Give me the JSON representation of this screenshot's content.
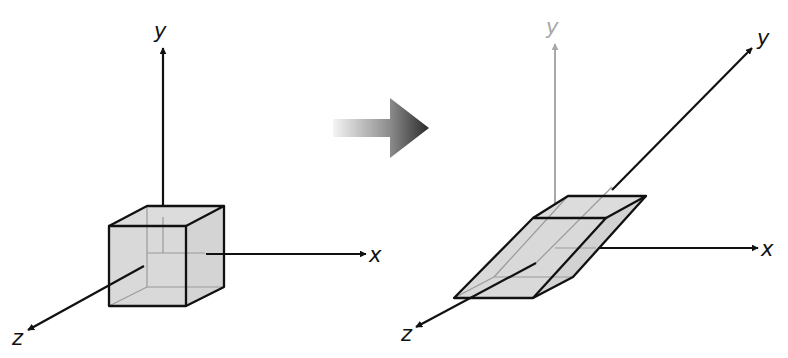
{
  "diagram": {
    "type": "3d-shear-transformation",
    "colors": {
      "stroke": "#111111",
      "face_fill": "#d9d9d9",
      "hidden_edge": "#9a9a9a",
      "faded_axis": "#a8a8a8",
      "arrow_gradient_start": "#f2f2f2",
      "arrow_gradient_end": "#222222"
    },
    "before": {
      "shape": "cube",
      "axes": {
        "x": "x",
        "y": "y",
        "z": "z"
      }
    },
    "transition_arrow": {
      "icon": "right-arrow-icon",
      "style": "gradient"
    },
    "after": {
      "shape": "sheared-parallelepiped",
      "axes": {
        "x": "x",
        "y": "y",
        "z": "z",
        "original_y": "y"
      }
    }
  }
}
